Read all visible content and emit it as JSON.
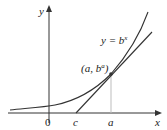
{
  "diagram": {
    "axes": {
      "x_label": "x",
      "y_label": "y"
    },
    "curve_label": "y = b",
    "curve_label_exp": "x",
    "point_label_prefix": "(a, b",
    "point_label_exp": "a",
    "point_label_suffix": ")",
    "tick_labels": {
      "origin": "0",
      "c": "c",
      "a": "a"
    },
    "colors": {
      "curve": "#333333",
      "axis": "#333333",
      "guide": "#bdbdbd"
    }
  }
}
